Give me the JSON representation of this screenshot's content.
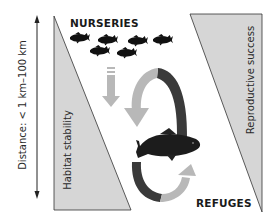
{
  "diagram": {
    "labels": {
      "top": "NURSERIES",
      "bottom": "REFUGES",
      "left_triangle": "Habitat stability",
      "right_triangle": "Reproductive success",
      "axis": "Distance: < 1 km–100 km"
    },
    "elements": {
      "distance_axis": "double-headed vertical arrow",
      "left_triangle": "habitat stability gradient, increasing downward",
      "right_triangle": "reproductive success gradient, increasing upward",
      "fish_school_count": 7,
      "large_fish": "carp",
      "cycle_arrows": [
        "down arrow (dashed tail)",
        "upper arc arrow to refuge",
        "lower arc arrow back to nurseries"
      ]
    },
    "colors": {
      "triangle_fill": "#d6d6d6",
      "triangle_stroke": "#333333",
      "arrow_light": "#b8b8b8",
      "arrow_dark": "#3a3a3a",
      "fish": "#111111",
      "text": "#1a1a1a"
    }
  }
}
